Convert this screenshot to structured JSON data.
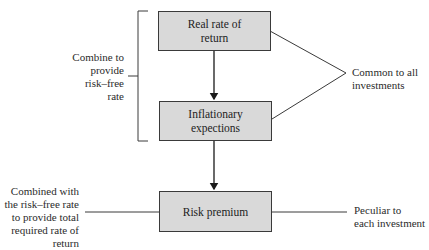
{
  "diagram": {
    "type": "flow",
    "nodes": [
      {
        "id": "real-rate",
        "label_line1": "Real rate of",
        "label_line2": "return"
      },
      {
        "id": "inflation",
        "label_line1": "Inflationary",
        "label_line2": "expections"
      },
      {
        "id": "risk-premium",
        "label_line1": "Risk premium"
      }
    ],
    "edges": [
      {
        "from": "real-rate",
        "to": "inflation",
        "arrow": true
      },
      {
        "from": "inflation",
        "to": "risk-premium",
        "arrow": true
      }
    ],
    "annotations": {
      "risk_free": {
        "line1": "Combine to",
        "line2": "provide",
        "line3": "risk–free",
        "line4": "rate"
      },
      "common": {
        "line1": "Common to all",
        "line2": "investments"
      },
      "total_required": {
        "line1": "Combined with",
        "line2": "the risk–free rate",
        "line3": "to provide total",
        "line4": "required rate of",
        "line5": "return"
      },
      "peculiar": {
        "line1": "Peculiar to",
        "line2": "each investment"
      }
    },
    "colors": {
      "box_fill": "#d9d9d9",
      "stroke": "#3a3a3a",
      "text": "#2b2b2b"
    }
  }
}
